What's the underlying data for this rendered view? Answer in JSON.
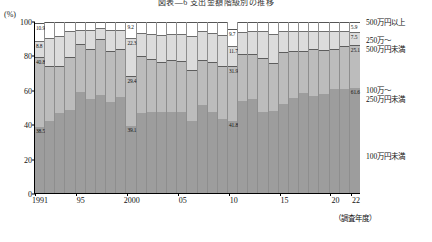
{
  "title": "図表―6  支出金額階級別の推移",
  "axes": {
    "y_unit": "(%)",
    "y_ticks": [
      100,
      80,
      60,
      40,
      20,
      0
    ],
    "y_min": 0,
    "y_max": 100,
    "x_caption": "（調査年度）",
    "x_ticks": [
      {
        "label": "1991",
        "year": 1991
      },
      {
        "label": "95",
        "year": 1995
      },
      {
        "label": "2000",
        "year": 2000
      },
      {
        "label": "05",
        "year": 2005
      },
      {
        "label": "10",
        "year": 2010
      },
      {
        "label": "15",
        "year": 2015
      },
      {
        "label": "20",
        "year": 2020
      },
      {
        "label": "22",
        "year": 2022
      }
    ]
  },
  "legend": [
    {
      "key": "s3",
      "label": "500万円以上",
      "label2": "",
      "color": "#ffffff"
    },
    {
      "key": "s2",
      "label": "250万～",
      "label2": "500万円未満",
      "color": "#dcdcdc"
    },
    {
      "key": "s1",
      "label": "100万～",
      "label2": "250万円未満",
      "color": "#bcbcbc"
    },
    {
      "key": "s0",
      "label": "100万円未満",
      "label2": "",
      "color": "#9d9d9d"
    }
  ],
  "legend_values": {
    "s3": "5.9",
    "s2": "7.5",
    "s1": "25.1",
    "s0": "61.6"
  },
  "chart_data": {
    "type": "bar",
    "stacked": true,
    "stack_total": 100,
    "title": "図表―6  支出金額階級別の推移",
    "xlabel": "（調査年度）",
    "ylabel": "(%)",
    "ylim": [
      0,
      100
    ],
    "grid": false,
    "legend_position": "right",
    "categories": [
      "1991",
      "1992",
      "1993",
      "1994",
      "1995",
      "1996",
      "1997",
      "1998",
      "1999",
      "2000",
      "2001",
      "2002",
      "2003",
      "2004",
      "2005",
      "2006",
      "2007",
      "2008",
      "2009",
      "2010",
      "2011",
      "2012",
      "2013",
      "2014",
      "2015",
      "2016",
      "2017",
      "2018",
      "2019",
      "2020",
      "2021",
      "2022"
    ],
    "series": [
      {
        "name": "100万円未満",
        "color": "#9d9d9d",
        "values": [
          38.5,
          42.0,
          47.0,
          48.5,
          59.0,
          55.0,
          57.5,
          53.0,
          56.0,
          39.1,
          47.0,
          47.5,
          47.5,
          47.5,
          47.5,
          42.0,
          51.5,
          47.5,
          43.5,
          41.8,
          54.0,
          55.0,
          47.5,
          48.0,
          52.0,
          55.5,
          58.5,
          57.0,
          58.0,
          61.0,
          61.0,
          61.6
        ]
      },
      {
        "name": "100万～250万円未満",
        "color": "#bcbcbc",
        "values": [
          40.8,
          32.0,
          27.0,
          31.0,
          28.0,
          29.5,
          32.5,
          30.0,
          28.0,
          29.4,
          33.0,
          31.0,
          29.0,
          30.5,
          29.5,
          30.0,
          26.5,
          29.0,
          30.5,
          31.9,
          27.5,
          26.0,
          31.5,
          28.0,
          30.5,
          27.5,
          24.5,
          27.0,
          25.5,
          23.0,
          25.0,
          25.1
        ]
      },
      {
        "name": "250万～500万円未満",
        "color": "#dcdcdc",
        "values": [
          8.8,
          16.5,
          18.0,
          15.0,
          8.5,
          11.0,
          6.5,
          12.5,
          11.5,
          22.3,
          13.5,
          14.5,
          16.0,
          15.0,
          16.0,
          20.0,
          16.5,
          17.0,
          18.5,
          11.7,
          12.5,
          13.5,
          15.5,
          17.0,
          12.5,
          12.0,
          11.5,
          11.0,
          11.0,
          10.5,
          8.5,
          7.5
        ]
      },
      {
        "name": "500万円以上",
        "color": "#ffffff",
        "values": [
          10.9,
          9.5,
          8.0,
          5.5,
          4.5,
          4.5,
          3.5,
          4.5,
          4.5,
          9.2,
          6.5,
          7.0,
          7.5,
          7.0,
          7.0,
          8.0,
          5.5,
          6.5,
          7.5,
          9.7,
          6.0,
          5.5,
          5.5,
          7.0,
          5.0,
          5.0,
          5.5,
          5.0,
          5.5,
          5.5,
          5.5,
          5.9
        ]
      }
    ],
    "point_labels": [
      {
        "year": 1991,
        "series": "500万円以上",
        "value": "10.9"
      },
      {
        "year": 1991,
        "series": "250万～500万円未満",
        "value": "8.8"
      },
      {
        "year": 1991,
        "series": "100万～250万円未満",
        "value": "40.8"
      },
      {
        "year": 1991,
        "series": "100万円未満",
        "value": "38.5"
      },
      {
        "year": 2000,
        "series": "500万円以上",
        "value": "9.2"
      },
      {
        "year": 2000,
        "series": "250万～500万円未満",
        "value": "22.3"
      },
      {
        "year": 2000,
        "series": "100万～250万円未満",
        "value": "29.4"
      },
      {
        "year": 2000,
        "series": "100万円未満",
        "value": "39.1"
      },
      {
        "year": 2010,
        "series": "500万円以上",
        "value": "9.7"
      },
      {
        "year": 2010,
        "series": "250万～500万円未満",
        "value": "11.7"
      },
      {
        "year": 2010,
        "series": "100万～250万円未満",
        "value": "31.9"
      },
      {
        "year": 2010,
        "series": "100万円未満",
        "value": "41.8"
      },
      {
        "year": 2022,
        "series": "500万円以上",
        "value": "5.9"
      },
      {
        "year": 2022,
        "series": "250万～500万円未満",
        "value": "7.5"
      },
      {
        "year": 2022,
        "series": "100万～250万円未満",
        "value": "25.1"
      },
      {
        "year": 2022,
        "series": "100万円未満",
        "value": "61.6"
      }
    ]
  }
}
